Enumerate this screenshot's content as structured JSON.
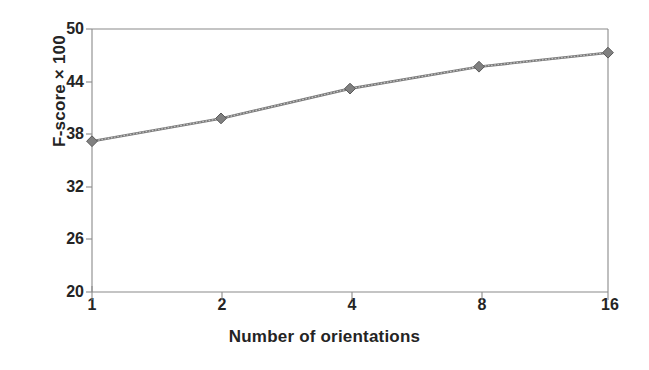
{
  "chart_data": {
    "type": "line",
    "title": "",
    "subtitle": "",
    "xlabel": "Number of orientations",
    "ylabel": "F-score × 100",
    "categories": [
      "1",
      "2",
      "4",
      "8",
      "16"
    ],
    "x": [
      1,
      2,
      4,
      8,
      16
    ],
    "values": [
      37.2,
      39.8,
      43.2,
      45.7,
      47.3
    ],
    "series": [
      {
        "name": "F-score",
        "values": [
          37.2,
          39.8,
          43.2,
          45.7,
          47.3
        ],
        "marker": "diamond",
        "color": "#6b6b6b"
      }
    ],
    "ylim": [
      20,
      50
    ],
    "yticks": [
      20,
      26,
      32,
      38,
      44,
      50
    ],
    "ytick_labels": [
      "20",
      "26",
      "32",
      "38",
      "44",
      "50"
    ],
    "xtick_labels": [
      "1",
      "2",
      "4",
      "8",
      "16"
    ],
    "grid": false,
    "legend": false,
    "legend_position": "none",
    "axis_scale_x": "categorical",
    "background_color": "#ffffff",
    "line_color": "#6b6b6b",
    "marker_color": "#808080",
    "axis_color": "#808080",
    "text_color": "#242424"
  },
  "axes": {
    "y_title": "F-score × 100",
    "x_title": "Number of orientations"
  }
}
